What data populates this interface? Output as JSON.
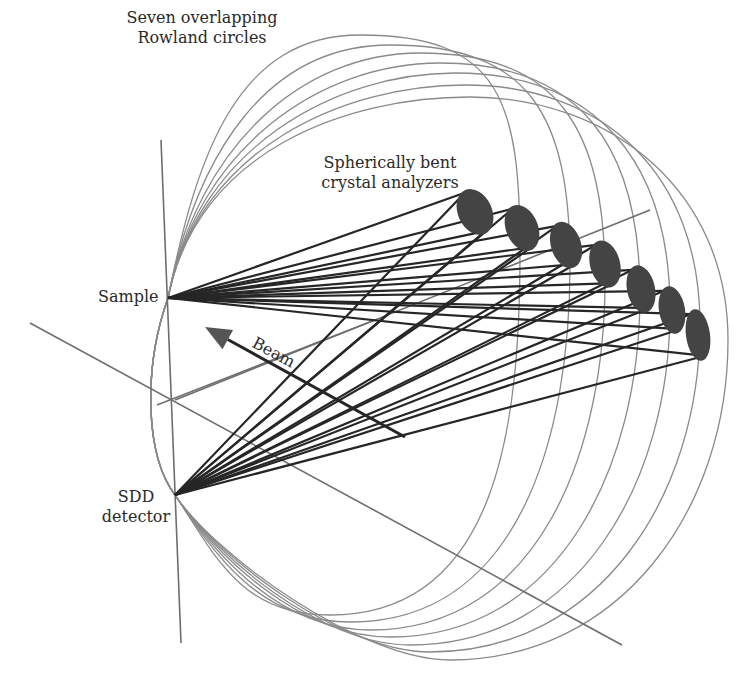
{
  "diagram": {
    "colors": {
      "background": "#ffffff",
      "circle": "#8a8a8a",
      "axis": "#6e6e6e",
      "ray": "#262626",
      "crystal": "#444444",
      "beam": "#555555",
      "text": "#2a2a2a"
    },
    "labels": {
      "rowland": "Seven overlapping\nRowland circles",
      "crystals": "Spherically bent\ncrystal analyzers",
      "sample": "Sample",
      "detector": "SDD\ndetector",
      "beam": "Beam"
    },
    "points": {
      "sample": [
        168,
        298
      ],
      "detector": [
        175,
        495
      ]
    },
    "crystals": [
      {
        "cx": 475,
        "cy": 212,
        "rx": 17,
        "ry": 24,
        "rot": -25
      },
      {
        "cx": 522,
        "cy": 228,
        "rx": 16,
        "ry": 24,
        "rot": -22
      },
      {
        "cx": 566,
        "cy": 245,
        "rx": 15,
        "ry": 24,
        "rot": -18
      },
      {
        "cx": 605,
        "cy": 264,
        "rx": 15,
        "ry": 24,
        "rot": -15
      },
      {
        "cx": 641,
        "cy": 289,
        "rx": 14,
        "ry": 24,
        "rot": -12
      },
      {
        "cx": 672,
        "cy": 310,
        "rx": 13,
        "ry": 24,
        "rot": -10
      },
      {
        "cx": 698,
        "cy": 335,
        "rx": 12,
        "ry": 26,
        "rot": -8
      }
    ],
    "circles": [
      {
        "top": [
          360,
          35
        ],
        "right": [
          520,
          250
        ],
        "bottom": [
          330,
          615
        ]
      },
      {
        "top": [
          390,
          45
        ],
        "right": [
          570,
          265
        ],
        "bottom": [
          350,
          622
        ]
      },
      {
        "top": [
          420,
          53
        ],
        "right": [
          605,
          280
        ],
        "bottom": [
          370,
          630
        ]
      },
      {
        "top": [
          440,
          63
        ],
        "right": [
          640,
          295
        ],
        "bottom": [
          390,
          637
        ]
      },
      {
        "top": [
          455,
          73
        ],
        "right": [
          670,
          310
        ],
        "bottom": [
          410,
          645
        ]
      },
      {
        "top": [
          465,
          85
        ],
        "right": [
          700,
          325
        ],
        "bottom": [
          430,
          652
        ]
      },
      {
        "top": [
          470,
          97
        ],
        "right": [
          728,
          340
        ],
        "bottom": [
          450,
          660
        ]
      }
    ],
    "axes": [
      {
        "x1": 161,
        "y1": 140,
        "x2": 181,
        "y2": 643
      },
      {
        "x1": 30,
        "y1": 323,
        "x2": 622,
        "y2": 645
      },
      {
        "x1": 157,
        "y1": 405,
        "x2": 375,
        "y2": 320
      },
      {
        "x1": 175,
        "y1": 400,
        "x2": 650,
        "y2": 210
      }
    ],
    "beam": {
      "x1": 405,
      "y1": 437,
      "x2": 205,
      "y2": 327
    }
  }
}
